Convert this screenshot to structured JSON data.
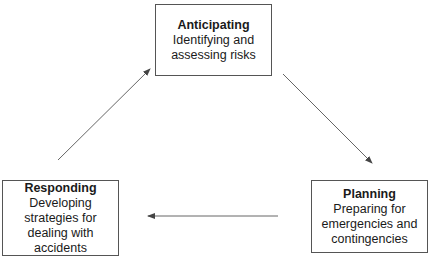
{
  "diagram": {
    "type": "cycle",
    "nodes": [
      {
        "id": "anticipating",
        "title": "Anticipating",
        "lines": [
          "Identifying and",
          "assessing risks"
        ]
      },
      {
        "id": "planning",
        "title": "Planning",
        "lines": [
          "Preparing for",
          "emergencies and",
          "contingencies"
        ]
      },
      {
        "id": "responding",
        "title": "Responding",
        "lines": [
          "Developing",
          "strategies for",
          "dealing with",
          "accidents"
        ]
      }
    ],
    "edges": [
      {
        "from": "anticipating",
        "to": "planning"
      },
      {
        "from": "planning",
        "to": "responding"
      },
      {
        "from": "responding",
        "to": "anticipating"
      }
    ],
    "colors": {
      "line": "#555555",
      "text": "#1a1a1a",
      "background": "#ffffff"
    }
  }
}
